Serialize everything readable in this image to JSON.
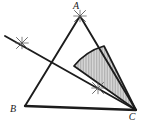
{
  "figure": {
    "background_color": "#ffffff",
    "stroke_color": "#1c1c1c",
    "construction_mark_color": "#5a5a5a",
    "shade_fill_color": "#d0d0d0",
    "shade_hatch_color": "#9a9a9a",
    "canvas": {
      "width": 145,
      "height": 121
    }
  },
  "vertices": {
    "a": {
      "label": "A",
      "x": 80,
      "y": 16,
      "label_x": 76,
      "label_y": 9
    },
    "b": {
      "label": "B",
      "x": 25,
      "y": 106,
      "label_x": 13,
      "label_y": 112
    },
    "c": {
      "label": "C",
      "x": 136,
      "y": 110,
      "label_x": 132,
      "label_y": 120
    }
  },
  "edges": [
    {
      "name": "side-ab",
      "from": "A",
      "to": "B",
      "x1": 80,
      "y1": 16,
      "x2": 25,
      "y2": 106
    },
    {
      "name": "side-bc",
      "from": "B",
      "to": "C",
      "x1": 25,
      "y1": 106,
      "x2": 136,
      "y2": 110
    },
    {
      "name": "side-ac",
      "from": "A",
      "to": "C",
      "x1": 80,
      "y1": 16,
      "x2": 136,
      "y2": 110
    }
  ],
  "bisector": {
    "name": "angle-bisector-from-C",
    "from": "C",
    "x1": 136,
    "y1": 110,
    "x2": 5,
    "y2": 36,
    "description": "bisector ray from vertex C extended past side AB"
  },
  "shaded_region": {
    "name": "bisected-angle-sector",
    "description": "shaded sector at vertex C between side AC and the bisector, bounded by an arc",
    "arc_radius": 60,
    "points": [
      {
        "x": 136,
        "y": 110
      },
      {
        "x": 104,
        "y": 46
      },
      {
        "x": 74,
        "y": 66
      }
    ]
  },
  "construction_marks": [
    {
      "name": "arc-cross-at-a",
      "x": 80,
      "y": 16,
      "size": 11,
      "rotation": 0
    },
    {
      "name": "arc-cross-on-bisector-left",
      "x": 22,
      "y": 43,
      "size": 11,
      "rotation": 0
    },
    {
      "name": "arc-cross-midfigure",
      "x": 98,
      "y": 88,
      "size": 11,
      "rotation": 0
    }
  ]
}
